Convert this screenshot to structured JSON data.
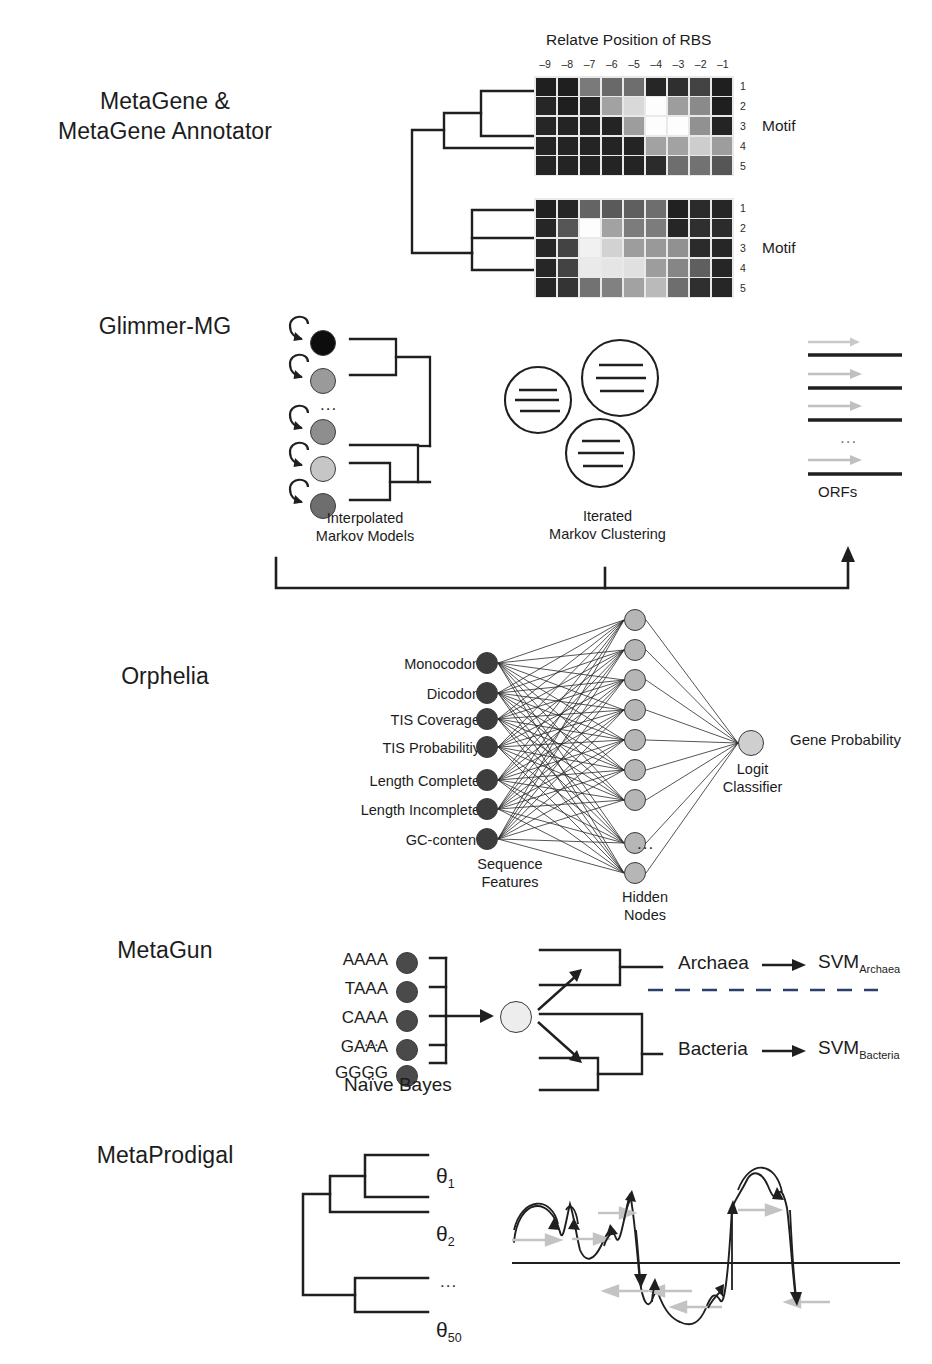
{
  "methods": [
    {
      "id": "metagene",
      "label": "MetaGene &\nMetaGene Annotator"
    },
    {
      "id": "glimmer-mg",
      "label": "Glimmer-MG"
    },
    {
      "id": "orphelia",
      "label": "Orphelia"
    },
    {
      "id": "metagun",
      "label": "MetaGun"
    },
    {
      "id": "metaprodigal",
      "label": "MetaProdigal"
    }
  ],
  "metagene": {
    "heatmap_title": "Relatve Position of RBS",
    "col_labels": [
      "–9",
      "–8",
      "–7",
      "–6",
      "–5",
      "–4",
      "–3",
      "–2",
      "–1"
    ],
    "row_labels": [
      "1",
      "2",
      "3",
      "4",
      "5"
    ],
    "motif_label": "Motif",
    "heatmaps": [
      {
        "name": "motif-heatmap-top",
        "rows": [
          [
            0.07,
            0.07,
            0.45,
            0.38,
            0.4,
            0.1,
            0.14,
            0.22,
            0.07
          ],
          [
            0.1,
            0.07,
            0.1,
            0.62,
            0.85,
            1.0,
            0.6,
            0.52,
            0.07
          ],
          [
            0.1,
            0.09,
            0.09,
            0.09,
            0.6,
            1.0,
            1.0,
            0.55,
            0.09
          ],
          [
            0.09,
            0.09,
            0.09,
            0.09,
            0.09,
            0.62,
            0.62,
            0.8,
            0.6
          ],
          [
            0.09,
            0.09,
            0.09,
            0.09,
            0.09,
            0.12,
            0.4,
            0.42,
            0.3
          ]
        ]
      },
      {
        "name": "motif-heatmap-bottom",
        "rows": [
          [
            0.08,
            0.1,
            0.36,
            0.32,
            0.34,
            0.4,
            0.08,
            0.12,
            0.1
          ],
          [
            0.1,
            0.3,
            1.0,
            0.62,
            0.46,
            0.46,
            0.1,
            0.14,
            0.12
          ],
          [
            0.1,
            0.22,
            0.95,
            0.82,
            0.6,
            0.58,
            0.55,
            0.12,
            0.1
          ],
          [
            0.1,
            0.22,
            0.92,
            0.9,
            0.88,
            0.6,
            0.5,
            0.34,
            0.1
          ],
          [
            0.1,
            0.16,
            0.42,
            0.48,
            0.62,
            0.72,
            0.4,
            0.14,
            0.1
          ]
        ]
      }
    ]
  },
  "glimmer": {
    "imm_caption": "Interpolated\nMarkov Models",
    "cluster_caption": "Iterated\nMarkov Clustering",
    "orfs_caption": "ORFs",
    "imm_node_shades": [
      "#0d0d0d",
      "#9a9a9a",
      "#8e8e8e",
      "#c6c6c6",
      "#6e6e6e"
    ],
    "imm_ellipsis": "...",
    "orf_ellipsis": "...",
    "orf_count": 4
  },
  "orphelia": {
    "feature_labels": [
      "Monocodon",
      "Dicodon",
      "TIS Coverage",
      "TIS Probabilitiy",
      "Length Complete",
      "Length Incomplete",
      "GC-content"
    ],
    "input_caption": "Sequence\nFeatures",
    "hidden_caption": "Hidden\nNodes",
    "hidden_ellipsis": "...",
    "hidden_node_count": 9,
    "classifier_caption": "Logit\nClassifier",
    "output_label": "Gene Probability",
    "colors": {
      "input_node": "#3d3d3d",
      "hidden_node": "#b6b6b6",
      "output_node": "#cfcfcf"
    }
  },
  "metagun": {
    "kmer_labels": [
      "AAAA",
      "TAAA",
      "CAAA",
      "GAAA",
      "GGGG"
    ],
    "kmer_ellipsis": "...",
    "bayes_caption": "Naïve Bayes",
    "branch_top_label": "Archaea",
    "branch_bottom_label": "Bacteria",
    "svm_top": {
      "base": "SVM",
      "sub": "Archaea"
    },
    "svm_bottom": {
      "base": "SVM",
      "sub": "Bacteria"
    },
    "node_shades": [
      "#4a4a4a",
      "#4a4a4a",
      "#4a4a4a",
      "#4a4a4a",
      "#4a4a4a"
    ],
    "center_node_shade": "#e0e0e0"
  },
  "metaprodigal": {
    "theta_labels": [
      {
        "base": "θ",
        "sub": "1"
      },
      {
        "base": "θ",
        "sub": "2"
      },
      {
        "base": "θ",
        "sub": "50"
      }
    ],
    "ellipsis": "..."
  },
  "colors": {
    "ink": "#1f1f1f",
    "grid_line": "#e9e9e9",
    "gray_arrow": "#b9b9b9"
  }
}
